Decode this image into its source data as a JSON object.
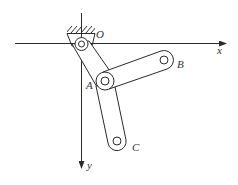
{
  "diagram": {
    "type": "mechanism",
    "colors": {
      "line": "#2a2a2a",
      "text": "#333333",
      "background": "#ffffff"
    },
    "axes": {
      "x_label": "x",
      "y_label": "y",
      "origin_label": "O"
    },
    "points": [
      {
        "id": "O",
        "label": "O",
        "role": "fixed-pivot"
      },
      {
        "id": "A",
        "label": "A",
        "role": "joint"
      },
      {
        "id": "B",
        "label": "B",
        "role": "link-end"
      },
      {
        "id": "C",
        "label": "C",
        "role": "link-end"
      }
    ],
    "links": [
      {
        "from": "O",
        "to": "A",
        "label": "OA"
      },
      {
        "from": "A",
        "to": "B",
        "label": "AB"
      },
      {
        "from": "A",
        "to": "C",
        "label": "AC"
      }
    ]
  }
}
